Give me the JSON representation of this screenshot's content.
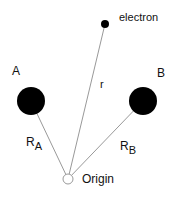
{
  "diagram": {
    "colors": {
      "background": "#ffffff",
      "nucleus_fill": "#000000",
      "line": "#999999",
      "text": "#111111"
    },
    "nodes": {
      "nucleus_a": {
        "label": "A",
        "cx": 31,
        "cy": 101,
        "r": 14
      },
      "nucleus_b": {
        "label": "B",
        "cx": 143,
        "cy": 101,
        "r": 14
      },
      "electron": {
        "label": "electron",
        "cx": 105,
        "cy": 24,
        "r": 4
      },
      "origin": {
        "label": "Origin",
        "cx": 68,
        "cy": 179,
        "r": 5
      }
    },
    "vectors": {
      "r": {
        "label": "r",
        "from": "origin",
        "to": "electron"
      },
      "ra": {
        "label": "R",
        "subscript": "A",
        "from": "origin",
        "to": "nucleus_a"
      },
      "rb": {
        "label": "R",
        "subscript": "B",
        "from": "origin",
        "to": "nucleus_b"
      }
    }
  }
}
